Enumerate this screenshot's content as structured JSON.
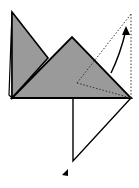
{
  "diagram": {
    "type": "origami-fold-step",
    "colors": {
      "background": "#ffffff",
      "paper_gray": "#9a9a9a",
      "outline": "#000000",
      "fold_line": "#333333"
    },
    "shapes": {
      "back_left_sliver": {
        "points": "12,12 9,95 12,98"
      },
      "back_left_triangle": {
        "points": "12,12 48,58 12,98"
      },
      "front_triangle": {
        "points": "12,98 72,37 131,98"
      },
      "lower_white_flap": {
        "points": "73,98 131,98 73,161"
      },
      "dotted_fold_lines": [
        {
          "x1": 77,
          "y1": 83,
          "x2": 131,
          "y2": 98
        },
        {
          "x1": 77,
          "y1": 83,
          "x2": 131,
          "y2": 14
        },
        {
          "x1": 131,
          "y1": 14,
          "x2": 131,
          "y2": 98
        }
      ],
      "curved_arrow": {
        "path": "M111,73 Q120,55 126,30",
        "head": "126,26 122,35 130,35"
      },
      "small_arrowhead": {
        "points": "68,169 62,175 68,176"
      }
    },
    "labels": {
      "title": "Fold the right flap up along the dotted line"
    }
  }
}
